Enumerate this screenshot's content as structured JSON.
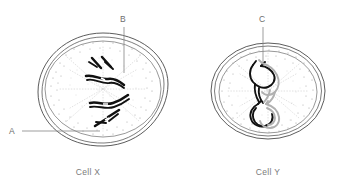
{
  "figure": {
    "background_color": "#ffffff",
    "ink_color": "#4a4a4a",
    "chromosome_dark_color": "#111111",
    "chromosome_light_color": "#b0b0b0",
    "label_color": "#6e6e6e",
    "caption_color": "#7a7a7a"
  },
  "labels": [
    {
      "id": "A",
      "text": "A",
      "target": "cell-membrane-cell-x"
    },
    {
      "id": "B",
      "text": "B",
      "target": "chromosome-region-cell-x"
    },
    {
      "id": "C",
      "text": "C",
      "target": "bivalent-cell-y"
    }
  ],
  "cells": [
    {
      "id": "cell-x",
      "caption": "Cell X",
      "chromosome_count": 4,
      "chromosome_type": "single-condensed",
      "structures": [
        "cell membrane",
        "nuclear envelope",
        "cytoplasm stipple",
        "spindle",
        "chromosomes"
      ]
    },
    {
      "id": "cell-y",
      "caption": "Cell Y",
      "chromosome_count": 2,
      "chromosome_type": "paired-bivalent-with-chiasma",
      "structures": [
        "cell membrane",
        "nuclear envelope",
        "cytoplasm stipple",
        "spindle",
        "bivalents"
      ]
    }
  ],
  "captions": {
    "left": "Cell X",
    "right": "Cell Y"
  }
}
